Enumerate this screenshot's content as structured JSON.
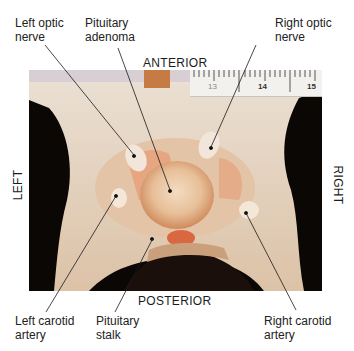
{
  "figure": {
    "orientation": {
      "top": "ANTERIOR",
      "bottom": "POSTERIOR",
      "left": "LEFT",
      "right": "RIGHT"
    },
    "labels": [
      {
        "id": "left-optic-nerve",
        "text": "Left optic\nnerve"
      },
      {
        "id": "pituitary-adenoma",
        "text": "Pituitary\nadenoma"
      },
      {
        "id": "right-optic-nerve",
        "text": "Right optic\nnerve"
      },
      {
        "id": "left-carotid-artery",
        "text": "Left carotid\nartery"
      },
      {
        "id": "pituitary-stalk",
        "text": "Pituitary\nstalk"
      },
      {
        "id": "right-carotid-artery",
        "text": "Right carotid\nartery"
      }
    ],
    "ruler": {
      "ticks": [
        "13",
        "14",
        "15"
      ]
    },
    "colors": {
      "bone": "#e8dccb",
      "tissue": "#d98a5a",
      "adenoma": "#e9c9a8",
      "background": "#0b0705",
      "leader": "#1a1a1a"
    }
  }
}
